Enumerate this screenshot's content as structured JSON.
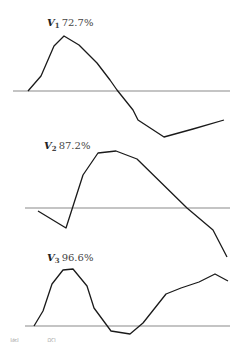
{
  "chart_data": [
    {
      "type": "line",
      "title": "V1 72.7%",
      "variable": "V",
      "subscript": "1",
      "percentage": "72.7%",
      "baseline": "zero line",
      "xlabel": "",
      "ylabel": "",
      "grid": false,
      "points_px": [
        [
          28,
          91
        ],
        [
          41,
          76
        ],
        [
          54,
          46
        ],
        [
          64,
          36
        ],
        [
          79,
          45
        ],
        [
          97,
          63
        ],
        [
          110,
          80
        ],
        [
          117,
          90
        ],
        [
          133,
          110
        ],
        [
          138,
          120
        ],
        [
          164,
          137
        ],
        [
          193,
          129
        ],
        [
          224,
          120
        ]
      ],
      "baseline_px": {
        "x1": 13,
        "x2": 230,
        "y": 91
      },
      "label_px": {
        "x": 47,
        "y": 23
      }
    },
    {
      "type": "line",
      "title": "V2 87.2%",
      "variable": "V",
      "subscript": "2",
      "percentage": "87.2%",
      "baseline": "zero line",
      "xlabel": "",
      "ylabel": "",
      "grid": false,
      "points_px": [
        [
          38,
          211
        ],
        [
          66,
          228
        ],
        [
          83,
          175
        ],
        [
          98,
          153
        ],
        [
          116,
          151
        ],
        [
          137,
          159
        ],
        [
          187,
          208
        ],
        [
          213,
          230
        ],
        [
          227,
          257
        ]
      ],
      "baseline_px": {
        "x1": 25,
        "x2": 230,
        "y": 208
      },
      "label_px": {
        "x": 44,
        "y": 146
      }
    },
    {
      "type": "line",
      "title": "V3 96.6%",
      "variable": "V",
      "subscript": "3",
      "percentage": "96.6%",
      "baseline": "zero line",
      "xlabel": "",
      "ylabel": "",
      "grid": false,
      "points_px": [
        [
          34,
          326
        ],
        [
          43,
          311
        ],
        [
          52,
          284
        ],
        [
          63,
          270
        ],
        [
          73,
          269
        ],
        [
          87,
          286
        ],
        [
          94,
          308
        ],
        [
          111,
          331
        ],
        [
          130,
          334
        ],
        [
          143,
          323
        ],
        [
          166,
          294
        ],
        [
          181,
          288
        ],
        [
          199,
          282
        ],
        [
          215,
          274
        ],
        [
          228,
          281
        ]
      ],
      "baseline_px": {
        "x1": 25,
        "x2": 230,
        "y": 326
      },
      "label_px": {
        "x": 47,
        "y": 258
      }
    }
  ],
  "panels": [
    {
      "var": "V",
      "sub": "1",
      "pct": "72.7%"
    },
    {
      "var": "V",
      "sub": "2",
      "pct": "87.2%"
    },
    {
      "var": "V",
      "sub": "3",
      "pct": "96.6%"
    }
  ],
  "caption": "图 . . . 的 . . . . . . . . . . . . . . . . ",
  "colors": {
    "curve": "#1a1a1a",
    "baseline": "#8a8a8a",
    "background": "#ffffff"
  }
}
